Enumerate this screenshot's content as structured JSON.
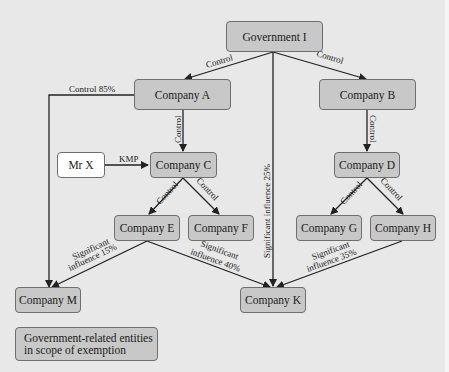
{
  "diagram": {
    "header_cut_text": "Figure: Example of related parties",
    "nodes": {
      "gov": "Government I",
      "a": "Company A",
      "b": "Company B",
      "c": "Company C",
      "d": "Company D",
      "e": "Company E",
      "f": "Company F",
      "g": "Company G",
      "h": "Company H",
      "m": "Company M",
      "k": "Company K",
      "mrx": "Mr X"
    },
    "edges": {
      "gov_a": "Control",
      "gov_b": "Control",
      "gov_k": "Significant influence 25%",
      "a_m": "Control 85%",
      "a_c": "Control",
      "b_d": "Control",
      "mrx_c": "KMP",
      "c_e": "Control",
      "c_f": "Control",
      "d_g": "Control",
      "d_h": "Control",
      "e_m_1": "Significant",
      "e_m_2": "influence 15%",
      "e_k_1": "Significant",
      "e_k_2": "influence 40%",
      "h_k_1": "Significant",
      "h_k_2": "influence 35%"
    },
    "legend": "Government-related entities in scope of exemption"
  },
  "colors": {
    "entity_fill": "#c8c8c8",
    "person_fill": "#ffffff",
    "background": "#e8e8e8",
    "line": "#222222"
  }
}
